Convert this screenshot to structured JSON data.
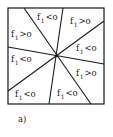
{
  "figure": {
    "caption": "a)",
    "box": {
      "x": 8,
      "y": 8,
      "width": 96,
      "height": 96
    },
    "center": {
      "x": 57,
      "y": 56
    },
    "stroke_color": "#1a1a1a",
    "lines": [
      {
        "id": "line-a",
        "x1": 24,
        "y1": 8,
        "x2": 91,
        "y2": 104
      },
      {
        "id": "line-b",
        "x1": 63,
        "y1": 8,
        "x2": 49,
        "y2": 104
      },
      {
        "id": "line-c",
        "x1": 104,
        "y1": 21,
        "x2": 8,
        "y2": 91
      },
      {
        "id": "line-d",
        "x1": 8,
        "y1": 47,
        "x2": 104,
        "y2": 64
      }
    ],
    "regions": [
      {
        "name": "region-top",
        "var": "f",
        "sub": "1",
        "op": "<o",
        "x": 37,
        "y": 13
      },
      {
        "name": "region-top-right",
        "var": "f",
        "sub": "1",
        "op": ">o",
        "x": 70,
        "y": 17
      },
      {
        "name": "region-upper-left",
        "var": "f",
        "sub": "1",
        "op": ">o",
        "x": 11,
        "y": 30
      },
      {
        "name": "region-right",
        "var": "f",
        "sub": "1",
        "op": "<o",
        "x": 76,
        "y": 44
      },
      {
        "name": "region-left",
        "var": "f",
        "sub": "1",
        "op": "<o",
        "x": 11,
        "y": 55
      },
      {
        "name": "region-lower-right",
        "var": "f",
        "sub": "1",
        "op": ">o",
        "x": 76,
        "y": 69
      },
      {
        "name": "region-bottom-left",
        "var": "f",
        "sub": "1",
        "op": "<o",
        "x": 15,
        "y": 90
      },
      {
        "name": "region-bottom",
        "var": "f",
        "sub": "1",
        "op": "<o",
        "x": 57,
        "y": 89
      }
    ]
  }
}
